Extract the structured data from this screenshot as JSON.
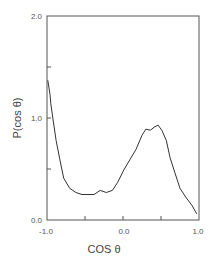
{
  "chart_data": {
    "type": "line",
    "title": "",
    "xlabel": "COS θ",
    "ylabel": "P(cos θ)",
    "xlim": [
      -1.0,
      1.0
    ],
    "ylim": [
      0.0,
      2.0
    ],
    "grid": false,
    "legend": null,
    "x_ticks": [
      -1.0,
      -0.5,
      0.0,
      0.5,
      1.0
    ],
    "x_tick_labels": [
      "-1.0",
      "",
      "0.0",
      "",
      "1.0"
    ],
    "y_ticks": [
      0.0,
      0.5,
      1.0,
      1.5,
      2.0
    ],
    "y_tick_labels": [
      "0.0",
      "",
      "1.0",
      "",
      "2.0"
    ],
    "series": [
      {
        "name": "P(cos θ)",
        "color": "#333333",
        "x": [
          -0.99,
          -0.96,
          -0.95,
          -0.92,
          -0.88,
          -0.83,
          -0.78,
          -0.7,
          -0.62,
          -0.54,
          -0.46,
          -0.38,
          -0.3,
          -0.22,
          -0.14,
          -0.07,
          0.01,
          0.09,
          0.17,
          0.25,
          0.3,
          0.36,
          0.41,
          0.46,
          0.51,
          0.57,
          0.62,
          0.68,
          0.75,
          0.83,
          0.91,
          0.97
        ],
        "y": [
          1.37,
          1.23,
          1.14,
          0.98,
          0.78,
          0.59,
          0.41,
          0.31,
          0.27,
          0.25,
          0.25,
          0.25,
          0.29,
          0.27,
          0.29,
          0.37,
          0.49,
          0.59,
          0.69,
          0.83,
          0.89,
          0.88,
          0.91,
          0.93,
          0.88,
          0.78,
          0.61,
          0.47,
          0.31,
          0.22,
          0.14,
          0.06
        ]
      }
    ]
  },
  "labels": {
    "x_axis": "COS θ",
    "y_axis": "P(cos θ)",
    "y_tick_0": "0.0",
    "y_tick_1": "1.0",
    "y_tick_2": "2.0",
    "x_tick_neg1": "-1.0",
    "x_tick_0": "0.0",
    "x_tick_1": "1.0"
  }
}
